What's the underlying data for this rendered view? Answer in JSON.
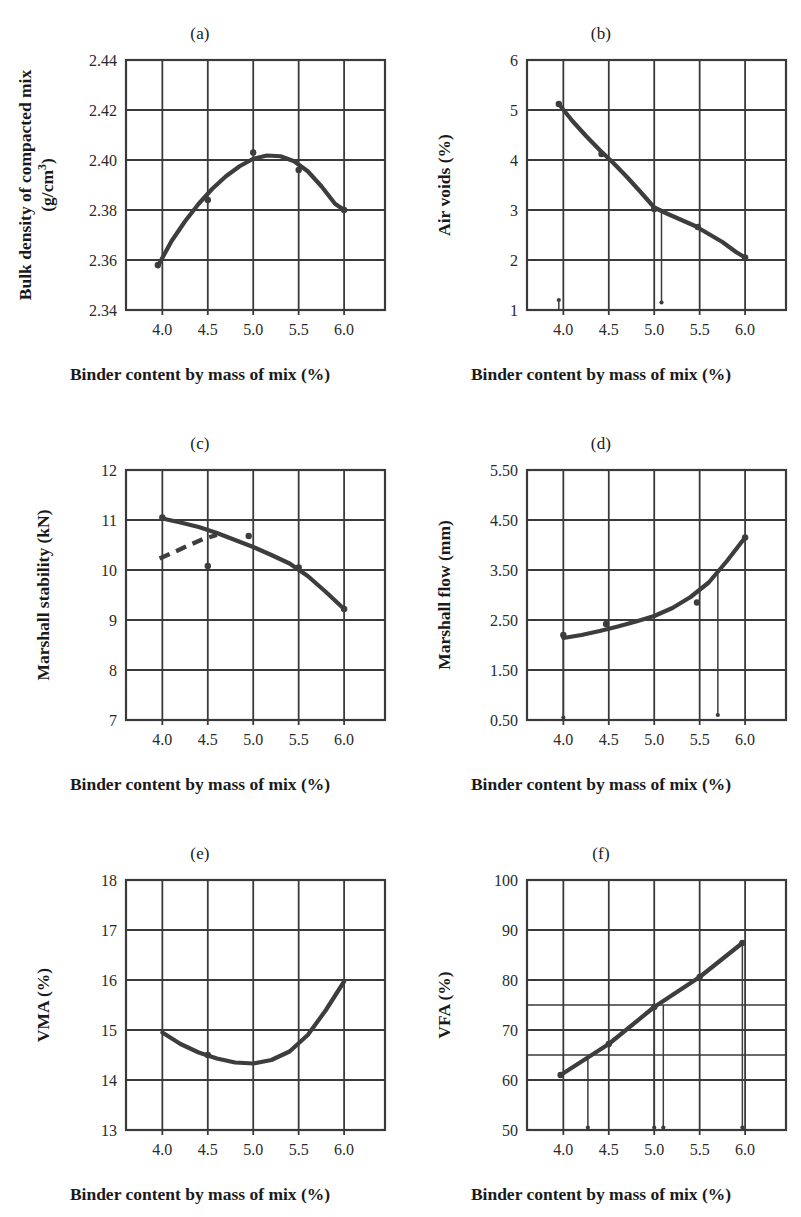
{
  "figure": {
    "xlabel": "Binder content by mass of mix (%)",
    "x_ticks": [
      "4.0",
      "4.5",
      "5.0",
      "5.5",
      "6.0"
    ]
  },
  "chart_data": [
    {
      "id": "a",
      "type": "line",
      "title": "(a)",
      "xlabel": "Binder content by mass of mix (%)",
      "ylabel": "Bulk density of compacted mix\n(g/cm3)",
      "ylabel_display": "Bulk density of compacted mix\n(g/cm³)",
      "xlim": [
        3.6,
        6.45
      ],
      "ylim": [
        2.34,
        2.44
      ],
      "x_ticks": [
        4.0,
        4.5,
        5.0,
        5.5,
        6.0
      ],
      "x_tick_labels": [
        "4.0",
        "4.5",
        "5.0",
        "5.5",
        "6.0"
      ],
      "y_ticks": [
        2.34,
        2.36,
        2.38,
        2.4,
        2.42,
        2.44
      ],
      "y_tick_labels": [
        "2.34",
        "2.36",
        "2.38",
        "2.40",
        "2.42",
        "2.44"
      ],
      "grid": true,
      "x": [
        4.0,
        4.5,
        5.0,
        5.5,
        6.0
      ],
      "values": [
        2.358,
        2.384,
        2.403,
        2.396,
        2.38
      ],
      "fit_curve": [
        [
          3.95,
          2.3575
        ],
        [
          4.1,
          2.3675
        ],
        [
          4.25,
          2.3755
        ],
        [
          4.4,
          2.3825
        ],
        [
          4.55,
          2.3885
        ],
        [
          4.7,
          2.3935
        ],
        [
          4.85,
          2.3975
        ],
        [
          5.0,
          2.4005
        ],
        [
          5.15,
          2.4018
        ],
        [
          5.3,
          2.4015
        ],
        [
          5.45,
          2.3995
        ],
        [
          5.6,
          2.3955
        ],
        [
          5.75,
          2.3895
        ],
        [
          5.9,
          2.3825
        ],
        [
          6.0,
          2.38
        ]
      ],
      "markers": [
        [
          3.95,
          2.358
        ],
        [
          4.5,
          2.384
        ],
        [
          5.0,
          2.403
        ],
        [
          5.5,
          2.396
        ],
        [
          6.0,
          2.38
        ]
      ],
      "droplines": []
    },
    {
      "id": "b",
      "type": "line",
      "title": "(b)",
      "xlabel": "Binder content by mass of mix (%)",
      "ylabel": "Air voids (%)",
      "ylabel_display": "Air voids (%)",
      "xlim": [
        3.6,
        6.45
      ],
      "ylim": [
        1,
        6
      ],
      "x_ticks": [
        4.0,
        4.5,
        5.0,
        5.5,
        6.0
      ],
      "x_tick_labels": [
        "4.0",
        "4.5",
        "5.0",
        "5.5",
        "6.0"
      ],
      "y_ticks": [
        1,
        2,
        3,
        4,
        5,
        6
      ],
      "y_tick_labels": [
        "1",
        "2",
        "3",
        "4",
        "5",
        "6"
      ],
      "grid": true,
      "x": [
        4.0,
        4.5,
        5.0,
        5.5,
        6.0
      ],
      "values": [
        5.1,
        4.1,
        3.0,
        2.65,
        2.05
      ],
      "fit_curve": [
        [
          3.95,
          5.12
        ],
        [
          4.1,
          4.78
        ],
        [
          4.25,
          4.48
        ],
        [
          4.4,
          4.2
        ],
        [
          4.55,
          3.94
        ],
        [
          4.7,
          3.66
        ],
        [
          4.85,
          3.36
        ],
        [
          5.0,
          3.05
        ],
        [
          5.15,
          2.92
        ],
        [
          5.3,
          2.8
        ],
        [
          5.45,
          2.68
        ],
        [
          5.6,
          2.52
        ],
        [
          5.75,
          2.36
        ],
        [
          5.9,
          2.16
        ],
        [
          6.0,
          2.05
        ]
      ],
      "markers": [
        [
          3.95,
          5.12
        ],
        [
          4.42,
          4.12
        ],
        [
          5.0,
          3.02
        ],
        [
          5.48,
          2.66
        ],
        [
          6.0,
          2.05
        ]
      ],
      "droplines": [
        {
          "x": 3.95,
          "from": 1.0,
          "to": 1.2
        },
        {
          "x": 5.08,
          "from": 3.0,
          "to": 1.15
        }
      ],
      "note": "vertical drop-line from the 3.0% air-voids design point down to the axis"
    },
    {
      "id": "c",
      "type": "line",
      "title": "(c)",
      "xlabel": "Binder content by mass of mix (%)",
      "ylabel": "Marshall stability (kN)",
      "ylabel_display": "Marshall stability (kN)",
      "xlim": [
        3.6,
        6.45
      ],
      "ylim": [
        7,
        12
      ],
      "x_ticks": [
        4.0,
        4.5,
        5.0,
        5.5,
        6.0
      ],
      "x_tick_labels": [
        "4.0",
        "4.5",
        "5.0",
        "5.5",
        "6.0"
      ],
      "y_ticks": [
        7,
        8,
        9,
        10,
        11,
        12
      ],
      "y_tick_labels": [
        "7",
        "8",
        "9",
        "10",
        "11",
        "12"
      ],
      "grid": true,
      "x": [
        4.0,
        4.5,
        5.0,
        5.5,
        6.0
      ],
      "values": [
        11.05,
        10.08,
        10.68,
        10.05,
        9.22
      ],
      "fit_curve": [
        [
          4.0,
          11.03
        ],
        [
          4.2,
          10.95
        ],
        [
          4.4,
          10.86
        ],
        [
          4.6,
          10.74
        ],
        [
          4.8,
          10.6
        ],
        [
          5.0,
          10.46
        ],
        [
          5.2,
          10.3
        ],
        [
          5.4,
          10.13
        ],
        [
          5.6,
          9.88
        ],
        [
          5.8,
          9.56
        ],
        [
          6.0,
          9.22
        ]
      ],
      "dashed_curve": [
        [
          3.97,
          10.23
        ],
        [
          4.12,
          10.35
        ],
        [
          4.3,
          10.5
        ],
        [
          4.45,
          10.62
        ],
        [
          4.6,
          10.7
        ]
      ],
      "markers": [
        [
          4.0,
          11.05
        ],
        [
          4.5,
          10.08
        ],
        [
          4.95,
          10.68
        ],
        [
          5.5,
          10.05
        ],
        [
          6.0,
          9.22
        ]
      ],
      "droplines": []
    },
    {
      "id": "d",
      "type": "line",
      "title": "(d)",
      "xlabel": "Binder content by mass of mix (%)",
      "ylabel": "Marshall flow (mm)",
      "ylabel_display": "Marshall flow (mm)",
      "xlim": [
        3.6,
        6.45
      ],
      "ylim": [
        0.5,
        5.5
      ],
      "x_ticks": [
        4.0,
        4.5,
        5.0,
        5.5,
        6.0
      ],
      "x_tick_labels": [
        "4.0",
        "4.5",
        "5.0",
        "5.5",
        "6.0"
      ],
      "y_ticks": [
        0.5,
        1.5,
        2.5,
        3.5,
        4.5,
        5.5
      ],
      "y_tick_labels": [
        "0.50",
        "1.50",
        "2.50",
        "3.50",
        "4.50",
        "5.50"
      ],
      "grid": true,
      "x": [
        4.0,
        4.5,
        5.0,
        5.5,
        6.0
      ],
      "values": [
        2.2,
        2.42,
        2.5,
        2.85,
        4.15
      ],
      "fit_curve": [
        [
          4.0,
          2.14
        ],
        [
          4.2,
          2.2
        ],
        [
          4.4,
          2.28
        ],
        [
          4.6,
          2.37
        ],
        [
          4.8,
          2.47
        ],
        [
          5.0,
          2.58
        ],
        [
          5.2,
          2.74
        ],
        [
          5.4,
          2.96
        ],
        [
          5.6,
          3.25
        ],
        [
          5.8,
          3.68
        ],
        [
          6.0,
          4.15
        ]
      ],
      "markers": [
        [
          4.0,
          2.2
        ],
        [
          4.47,
          2.42
        ],
        [
          5.47,
          2.85
        ],
        [
          6.0,
          4.15
        ]
      ],
      "droplines": [
        {
          "x": 4.0,
          "from": 2.18,
          "to": 0.55
        },
        {
          "x": 5.7,
          "from": 3.5,
          "to": 0.6
        }
      ]
    },
    {
      "id": "e",
      "type": "line",
      "title": "(e)",
      "xlabel": "Binder content by mass of mix (%)",
      "ylabel": "VMA (%)",
      "ylabel_display": "VMA (%)",
      "xlim": [
        3.6,
        6.45
      ],
      "ylim": [
        13,
        18
      ],
      "x_ticks": [
        4.0,
        4.5,
        5.0,
        5.5,
        6.0
      ],
      "x_tick_labels": [
        "4.0",
        "4.5",
        "5.0",
        "5.5",
        "6.0"
      ],
      "y_ticks": [
        13,
        14,
        15,
        16,
        17,
        18
      ],
      "y_tick_labels": [
        "13",
        "14",
        "15",
        "16",
        "17",
        "18"
      ],
      "grid": true,
      "x": [
        4.0,
        4.5,
        5.0,
        5.5,
        6.0
      ],
      "values": [
        14.95,
        14.5,
        14.33,
        14.95,
        15.97
      ],
      "fit_curve": [
        [
          4.0,
          14.95
        ],
        [
          4.2,
          14.72
        ],
        [
          4.4,
          14.55
        ],
        [
          4.6,
          14.43
        ],
        [
          4.8,
          14.35
        ],
        [
          5.0,
          14.33
        ],
        [
          5.2,
          14.4
        ],
        [
          5.4,
          14.57
        ],
        [
          5.6,
          14.9
        ],
        [
          5.8,
          15.4
        ],
        [
          6.0,
          15.97
        ]
      ],
      "markers": [
        [
          4.5,
          14.5
        ]
      ],
      "droplines": []
    },
    {
      "id": "f",
      "type": "line",
      "title": "(f)",
      "xlabel": "Binder content by mass of mix (%)",
      "ylabel": "VFA (%)",
      "ylabel_display": "VFA (%)",
      "xlim": [
        3.6,
        6.45
      ],
      "ylim": [
        50,
        100
      ],
      "x_ticks": [
        4.0,
        4.5,
        5.0,
        5.5,
        6.0
      ],
      "x_tick_labels": [
        "4.0",
        "4.5",
        "5.0",
        "5.5",
        "6.0"
      ],
      "y_ticks": [
        50,
        60,
        70,
        80,
        90,
        100
      ],
      "y_tick_labels": [
        "50",
        "60",
        "70",
        "80",
        "90",
        "100"
      ],
      "minor_y_ticks": [
        65,
        75
      ],
      "grid": true,
      "x": [
        4.0,
        4.5,
        5.0,
        5.5,
        6.0
      ],
      "values": [
        61,
        67,
        74.5,
        80.5,
        87.5
      ],
      "fit_curve": [
        [
          3.97,
          61.0
        ],
        [
          4.5,
          67.2
        ],
        [
          5.0,
          74.6
        ],
        [
          5.5,
          80.6
        ],
        [
          5.97,
          87.4
        ]
      ],
      "markers": [
        [
          3.97,
          61.0
        ],
        [
          4.5,
          67.2
        ],
        [
          5.0,
          74.6
        ],
        [
          5.5,
          80.6
        ],
        [
          5.97,
          87.4
        ]
      ],
      "droplines": [
        {
          "x": 4.27,
          "from": 65.0,
          "to": 50.5
        },
        {
          "x": 5.0,
          "from": 74.6,
          "to": 50.5
        },
        {
          "x": 5.1,
          "from": 75.0,
          "to": 50.5
        },
        {
          "x": 5.97,
          "from": 87.4,
          "to": 50.5
        }
      ],
      "note": "minor horizontal gridlines drawn at VFA = 65 and 75 with drop-lines to the axis"
    }
  ],
  "colors": {
    "ink": "#2a2a2a",
    "grid": "#3a3a3a",
    "curve": "#3d3d3d",
    "background": "#ffffff"
  }
}
